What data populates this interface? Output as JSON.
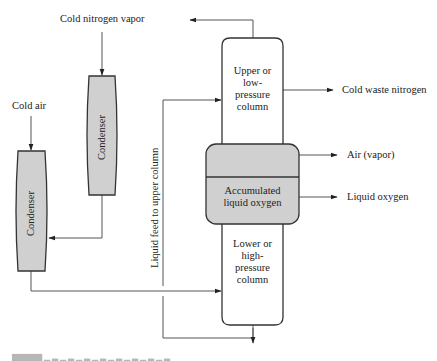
{
  "diagram": {
    "type": "process-flow",
    "colors": {
      "stroke": "#333333",
      "fill_shaded": "#d0d0d0",
      "fill_plain": "#ffffff",
      "text": "#222222"
    },
    "nodes": {
      "condenser_left": {
        "label": "Condenser"
      },
      "condenser_right": {
        "label": "Condenser"
      },
      "upper_column": {
        "label_lines": [
          "Upper or",
          "low-",
          "pressure",
          "column"
        ]
      },
      "accumulated_oxygen": {
        "label_lines": [
          "Accumulated",
          "liquid oxygen"
        ]
      },
      "lower_column": {
        "label_lines": [
          "Lower or",
          "high-",
          "pressure",
          "column"
        ]
      }
    },
    "inputs": {
      "cold_nitrogen_vapor": "Cold nitrogen vapor",
      "cold_air": "Cold air"
    },
    "outputs": {
      "cold_waste_nitrogen": "Cold waste nitrogen",
      "air_vapor": "Air (vapor)",
      "liquid_oxygen": "Liquid oxygen"
    },
    "streams": {
      "liquid_feed": "Liquid feed to upper column"
    },
    "edges": [
      {
        "from": "cold_nitrogen_vapor",
        "to": "condenser_right"
      },
      {
        "from": "condenser_right",
        "to": "condenser_left"
      },
      {
        "from": "cold_air",
        "to": "condenser_left"
      },
      {
        "from": "condenser_left",
        "to": "lower_column"
      },
      {
        "from": "lower_column",
        "to": "upper_column",
        "label": "Liquid feed to upper column"
      },
      {
        "from": "upper_column",
        "to": "top_outlet_left"
      },
      {
        "from": "upper_column",
        "to": "cold_waste_nitrogen"
      },
      {
        "from": "accumulated_oxygen",
        "to": "air_vapor"
      },
      {
        "from": "accumulated_oxygen",
        "to": "liquid_oxygen"
      }
    ],
    "caption_clipped": true
  }
}
